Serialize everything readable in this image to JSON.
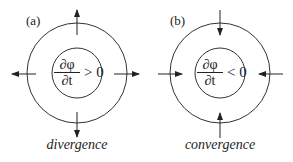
{
  "panels": [
    {
      "label": "(a)",
      "numerator": "∂φ",
      "denominator": "∂t",
      "relation": "> 0",
      "caption": "divergence",
      "arrow_direction": "outward"
    },
    {
      "label": "(b)",
      "numerator": "∂φ",
      "denominator": "∂t",
      "relation": "< 0",
      "caption": "convergence",
      "arrow_direction": "inward"
    }
  ],
  "colors": {
    "stroke": "#222222",
    "background": "#ffffff"
  }
}
